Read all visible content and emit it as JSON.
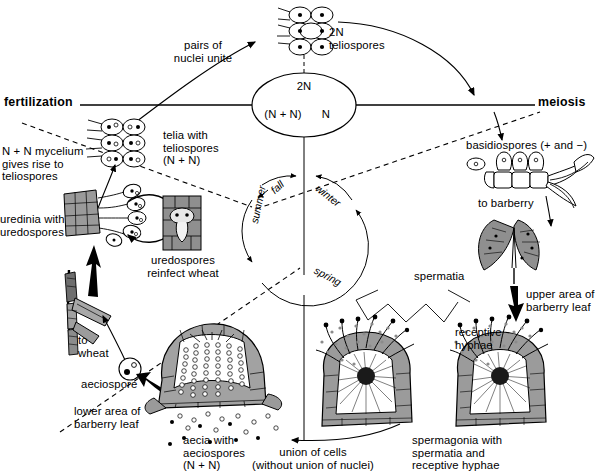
{
  "figure": {
    "type": "biology-life-cycle-diagram",
    "width": 596,
    "height": 473,
    "background_color": "#ffffff",
    "line_color": "#000000",
    "fill_gray": "#9a9a9a",
    "fill_light": "#cfcfcf"
  },
  "axes": {
    "fertilization_label": "fertilization",
    "meiosis_label": "meiosis"
  },
  "nuclear_phase": {
    "top": "2N",
    "bottom_left": "(N + N)",
    "bottom_right": "N"
  },
  "seasons": {
    "fall": "fall",
    "winter": "winter",
    "summer": "summer",
    "spring": "spring"
  },
  "labels": {
    "pairs_of_nuclei_unite": "pairs of\nnuclei unite",
    "teliospores_2n": "2N\nteliospores",
    "telia_with_teliospores": "telia with\nteliospores\n(N + N)",
    "mycelium_gives_rise": "N + N mycelium\ngives rise to\nteliospores",
    "uredinia_with_uredospores": "uredinia with\nuredospores",
    "uredospores_reinfect_wheat": "uredospores\nreinfect wheat",
    "to_wheat": "to\nwheat",
    "aeciospore": "aeciospore",
    "lower_area_of_barberry_leaf": "lower area of\nbarberry leaf",
    "aecia_with_aeciospores": "aecia with\naeciospores\n(N + N)",
    "union_of_cells": "union of cells\n(without union of nuclei)",
    "spermagonia": "spermagonia with\nspermatia and\nreceptive hyphae",
    "spermatia": "spermatia",
    "receptive_hyphae": "receptive\nhyphae",
    "upper_area_of_barberry_leaf": "upper area of\nbarberry leaf",
    "basidiospores": "basidiospores (+ and −)",
    "to_barberry": "to barberry"
  },
  "illustrations": [
    {
      "name": "teliospore-cluster-2n",
      "caption_ref": "teliospores_2n"
    },
    {
      "name": "telia-cluster",
      "caption_ref": "telia_with_teliospores"
    },
    {
      "name": "uredinia-cluster",
      "caption_ref": "uredinia_with_uredospores"
    },
    {
      "name": "wheat-stem-section",
      "caption_ref": "uredospores_reinfect_wheat"
    },
    {
      "name": "wheat-plant",
      "caption_ref": "to_wheat"
    },
    {
      "name": "aeciospore-single",
      "caption_ref": "aeciospore"
    },
    {
      "name": "aecium-cup",
      "caption_ref": "aecia_with_aeciospores"
    },
    {
      "name": "spermagonium-left",
      "caption_ref": "spermagonia"
    },
    {
      "name": "spermagonium-right",
      "caption_ref": "spermagonia"
    },
    {
      "name": "barberry-leaf",
      "caption_ref": "upper_area_of_barberry_leaf"
    },
    {
      "name": "basidium-with-basidiospores",
      "caption_ref": "basidiospores"
    }
  ]
}
